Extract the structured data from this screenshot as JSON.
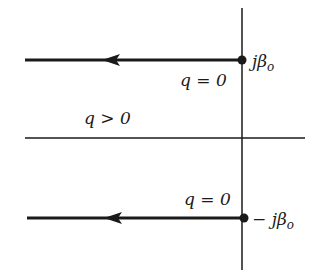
{
  "diagram": {
    "labels": {
      "upper_pole": "jβ",
      "upper_pole_sub": "o",
      "lower_pole": "− jβ",
      "lower_pole_sub": "o",
      "upper_q": "q = 0",
      "lower_q": "q = 0",
      "region": "q > 0"
    },
    "colors": {
      "line": "#1a1a1a",
      "background": "#ffffff"
    }
  }
}
